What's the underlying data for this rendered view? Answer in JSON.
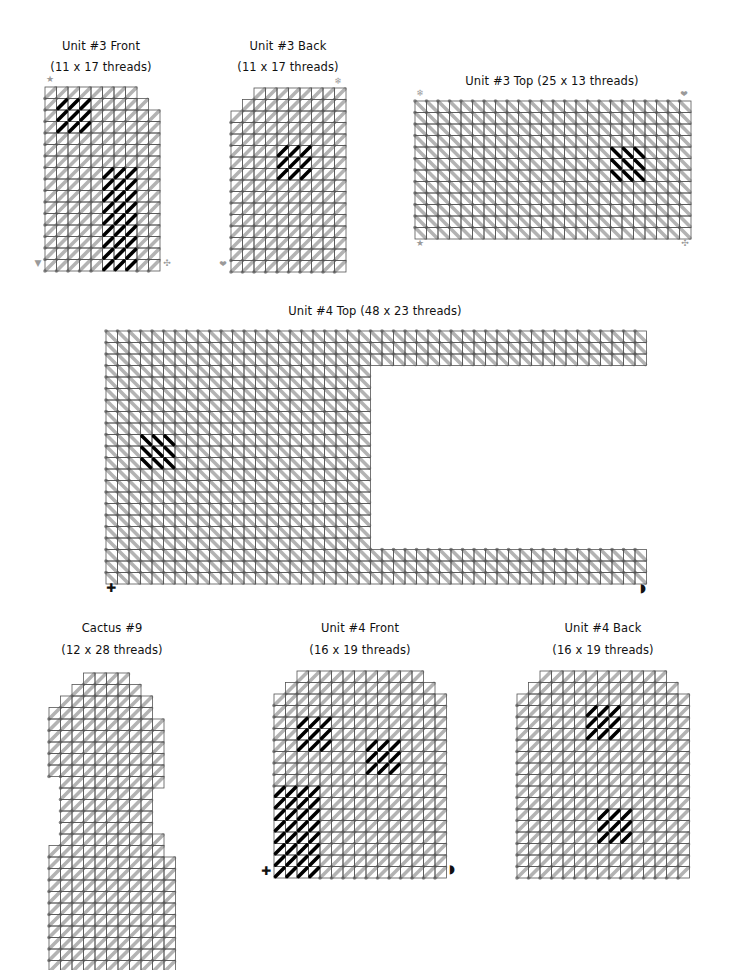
{
  "page": {
    "width": 731,
    "height": 970,
    "colors": {
      "grid_line": "#555555",
      "stitch_grey": "#b3b3b3",
      "stitch_dot": "#8a8a8a",
      "stitch_black": "#000000",
      "marker_grey": "#9a9a9a"
    },
    "cell": 11.5
  },
  "pieces": [
    {
      "id": "unit3-front",
      "title_line1": "Unit #3 Front",
      "title_line2": "(11 x 17 threads)",
      "title_x": 101,
      "title_y1": 47,
      "title_y2": 68,
      "origin": [
        44,
        86
      ],
      "cols": 10,
      "rows": 16,
      "stitch_dir": "fwd",
      "rows_spans": [
        [
          0,
          8
        ],
        [
          0,
          9
        ],
        [
          0,
          10
        ],
        [
          0,
          10
        ],
        [
          0,
          10
        ],
        [
          0,
          10
        ],
        [
          0,
          10
        ],
        [
          0,
          10
        ],
        [
          0,
          10
        ],
        [
          0,
          10
        ],
        [
          0,
          10
        ],
        [
          0,
          10
        ],
        [
          0,
          10
        ],
        [
          0,
          10
        ],
        [
          0,
          10
        ],
        [
          0,
          10
        ]
      ],
      "black_blocks": [
        {
          "c0": 1,
          "r0": 1,
          "c1": 4,
          "r1": 4
        },
        {
          "c0": 5,
          "r0": 7,
          "c1": 8,
          "r1": 16
        }
      ],
      "markers": [
        {
          "symbol": "★",
          "name": "star-marker-icon",
          "x": 50,
          "y": 79
        },
        {
          "symbol": "▼",
          "name": "triangle-marker-icon",
          "x": 38,
          "y": 263
        },
        {
          "symbol": "✣",
          "name": "flower-marker-icon",
          "x": 167,
          "y": 263
        }
      ]
    },
    {
      "id": "unit3-back",
      "title_line1": "Unit #3 Back",
      "title_line2": "(11 x 17 threads)",
      "title_x": 288,
      "title_y1": 47,
      "title_y2": 68,
      "origin": [
        230,
        87
      ],
      "cols": 10,
      "rows": 16,
      "stitch_dir": "fwd",
      "rows_spans": [
        [
          2,
          10
        ],
        [
          1,
          10
        ],
        [
          0,
          10
        ],
        [
          0,
          10
        ],
        [
          0,
          10
        ],
        [
          0,
          10
        ],
        [
          0,
          10
        ],
        [
          0,
          10
        ],
        [
          0,
          10
        ],
        [
          0,
          10
        ],
        [
          0,
          10
        ],
        [
          0,
          10
        ],
        [
          0,
          10
        ],
        [
          0,
          10
        ],
        [
          0,
          10
        ],
        [
          0,
          10
        ]
      ],
      "black_blocks": [
        {
          "c0": 4,
          "r0": 5,
          "c1": 7,
          "r1": 8
        }
      ],
      "markers": [
        {
          "symbol": "❄",
          "name": "snowflake-marker-icon",
          "x": 338,
          "y": 81
        },
        {
          "symbol": "❤",
          "name": "heart-marker-icon",
          "x": 223,
          "y": 264
        }
      ]
    },
    {
      "id": "unit3-top",
      "title_line1": "Unit #3 Top (25 x 13 threads)",
      "title_line2": "",
      "title_x": 552,
      "title_y1": 82,
      "title_y2": 0,
      "origin": [
        414,
        100
      ],
      "cols": 24,
      "rows": 12,
      "stitch_dir": "back",
      "rows_spans": [
        [
          0,
          24
        ],
        [
          0,
          24
        ],
        [
          0,
          24
        ],
        [
          0,
          24
        ],
        [
          0,
          24
        ],
        [
          0,
          24
        ],
        [
          0,
          24
        ],
        [
          0,
          24
        ],
        [
          0,
          24
        ],
        [
          0,
          24
        ],
        [
          0,
          24
        ],
        [
          0,
          24
        ]
      ],
      "black_blocks": [
        {
          "c0": 17,
          "r0": 4,
          "c1": 20,
          "r1": 7
        }
      ],
      "markers": [
        {
          "symbol": "❄",
          "name": "snowflake-marker-icon",
          "x": 420,
          "y": 93
        },
        {
          "symbol": "❤",
          "name": "heart-marker-icon",
          "x": 684,
          "y": 94
        },
        {
          "symbol": "★",
          "name": "star-marker-icon",
          "x": 420,
          "y": 243
        },
        {
          "symbol": "✣",
          "name": "flower-marker-icon",
          "x": 685,
          "y": 243
        }
      ]
    },
    {
      "id": "unit4-top",
      "title_line1": "Unit #4 Top (48 x 23 threads)",
      "title_line2": "",
      "title_x": 375,
      "title_y1": 312,
      "title_y2": 0,
      "origin": [
        105,
        330
      ],
      "cols": 47,
      "rows": 22,
      "stitch_dir": "back",
      "rows_spans": [
        [
          0,
          47
        ],
        [
          0,
          47
        ],
        [
          0,
          47
        ],
        [
          0,
          23
        ],
        [
          0,
          23
        ],
        [
          0,
          23
        ],
        [
          0,
          23
        ],
        [
          0,
          23
        ],
        [
          0,
          23
        ],
        [
          0,
          23
        ],
        [
          0,
          23
        ],
        [
          0,
          23
        ],
        [
          0,
          23
        ],
        [
          0,
          23
        ],
        [
          0,
          23
        ],
        [
          0,
          23
        ],
        [
          0,
          23
        ],
        [
          0,
          23
        ],
        [
          0,
          23
        ],
        [
          0,
          47
        ],
        [
          0,
          47
        ],
        [
          0,
          47
        ]
      ],
      "black_blocks": [
        {
          "c0": 3,
          "r0": 9,
          "c1": 6,
          "r1": 12
        }
      ],
      "markers": [
        {
          "symbol": "✚",
          "name": "cross-marker-icon",
          "x": 111,
          "y": 588,
          "dark": true
        },
        {
          "symbol": "◗",
          "name": "half-circle-marker-icon",
          "x": 643,
          "y": 588,
          "dark": true
        }
      ]
    },
    {
      "id": "cactus-9",
      "title_line1": "Cactus #9",
      "title_line2": "(12 x 28 threads)",
      "title_x": 112,
      "title_y1": 629,
      "title_y2": 651,
      "origin": [
        48,
        672
      ],
      "cols": 11,
      "rows": 27,
      "stitch_dir": "fwd",
      "rows_spans": [
        [
          3,
          7
        ],
        [
          2,
          8
        ],
        [
          1,
          9
        ],
        [
          0,
          9
        ],
        [
          0,
          10
        ],
        [
          0,
          10
        ],
        [
          0,
          10
        ],
        [
          0,
          10
        ],
        [
          0,
          10
        ],
        [
          1,
          10
        ],
        [
          1,
          9
        ],
        [
          1,
          9
        ],
        [
          1,
          9
        ],
        [
          1,
          9
        ],
        [
          1,
          10
        ],
        [
          0,
          10
        ],
        [
          0,
          11
        ],
        [
          0,
          11
        ],
        [
          0,
          11
        ],
        [
          0,
          11
        ],
        [
          0,
          11
        ],
        [
          0,
          11
        ],
        [
          0,
          11
        ],
        [
          0,
          11
        ],
        [
          0,
          11
        ],
        [
          0,
          11
        ],
        [
          1,
          10
        ]
      ],
      "black_blocks": [],
      "markers": []
    },
    {
      "id": "unit4-front",
      "title_line1": "Unit #4 Front",
      "title_line2": "(16 x 19 threads)",
      "title_x": 360,
      "title_y1": 629,
      "title_y2": 651,
      "origin": [
        273,
        670
      ],
      "cols": 15,
      "rows": 18,
      "stitch_dir": "fwd",
      "rows_spans": [
        [
          2,
          13
        ],
        [
          1,
          14
        ],
        [
          0,
          15
        ],
        [
          0,
          15
        ],
        [
          0,
          15
        ],
        [
          0,
          15
        ],
        [
          0,
          15
        ],
        [
          0,
          15
        ],
        [
          0,
          15
        ],
        [
          0,
          15
        ],
        [
          0,
          15
        ],
        [
          0,
          15
        ],
        [
          0,
          15
        ],
        [
          0,
          15
        ],
        [
          0,
          15
        ],
        [
          0,
          15
        ],
        [
          0,
          15
        ],
        [
          0,
          15
        ]
      ],
      "black_blocks": [
        {
          "c0": 2,
          "r0": 4,
          "c1": 5,
          "r1": 7
        },
        {
          "c0": 8,
          "r0": 6,
          "c1": 11,
          "r1": 9
        },
        {
          "c0": 0,
          "r0": 10,
          "c1": 4,
          "r1": 18
        }
      ],
      "markers": [
        {
          "symbol": "✚",
          "name": "cross-marker-icon",
          "x": 266,
          "y": 871,
          "dark": true
        },
        {
          "symbol": "◗",
          "name": "half-circle-marker-icon",
          "x": 452,
          "y": 869,
          "dark": true
        }
      ]
    },
    {
      "id": "unit4-back",
      "title_line1": "Unit #4 Back",
      "title_line2": "(16 x 19 threads)",
      "title_x": 603,
      "title_y1": 629,
      "title_y2": 651,
      "origin": [
        516,
        670
      ],
      "cols": 15,
      "rows": 18,
      "stitch_dir": "fwd",
      "rows_spans": [
        [
          2,
          13
        ],
        [
          1,
          14
        ],
        [
          0,
          15
        ],
        [
          0,
          15
        ],
        [
          0,
          15
        ],
        [
          0,
          15
        ],
        [
          0,
          15
        ],
        [
          0,
          15
        ],
        [
          0,
          15
        ],
        [
          0,
          15
        ],
        [
          0,
          15
        ],
        [
          0,
          15
        ],
        [
          0,
          15
        ],
        [
          0,
          15
        ],
        [
          0,
          15
        ],
        [
          0,
          15
        ],
        [
          0,
          15
        ],
        [
          0,
          15
        ]
      ],
      "black_blocks": [
        {
          "c0": 6,
          "r0": 3,
          "c1": 9,
          "r1": 6
        },
        {
          "c0": 7,
          "r0": 12,
          "c1": 10,
          "r1": 15
        }
      ],
      "markers": []
    }
  ]
}
